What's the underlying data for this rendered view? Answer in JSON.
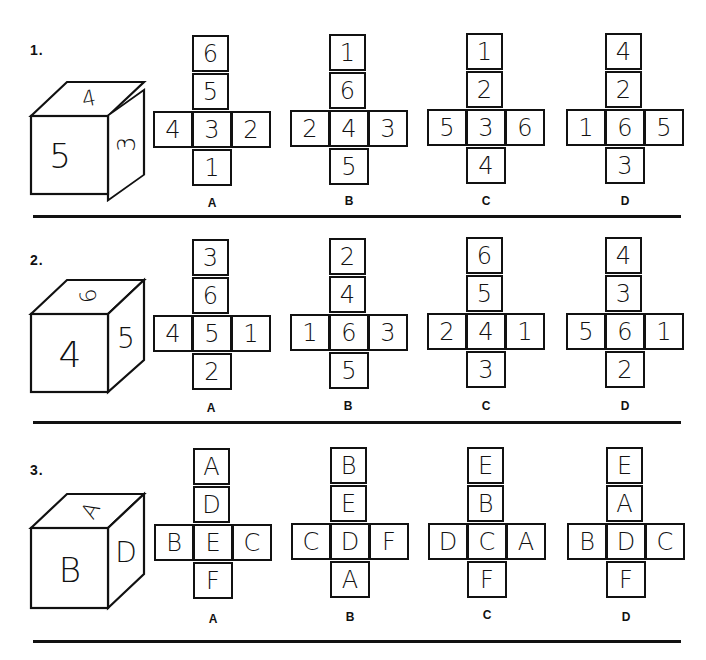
{
  "questions": [
    {
      "number": "1.",
      "cube": {
        "front": "5",
        "top": "4",
        "right": "3"
      },
      "options": [
        {
          "label": "A",
          "top": "6",
          "upper": "5",
          "left": "4",
          "center": "3",
          "right": "2",
          "bottom": "1"
        },
        {
          "label": "B",
          "top": "1",
          "upper": "6",
          "left": "2",
          "center": "4",
          "right": "3",
          "bottom": "5"
        },
        {
          "label": "C",
          "top": "1",
          "upper": "2",
          "left": "5",
          "center": "3",
          "right": "6",
          "bottom": "4"
        },
        {
          "label": "D",
          "top": "4",
          "upper": "2",
          "left": "1",
          "center": "6",
          "right": "5",
          "bottom": "3"
        }
      ]
    },
    {
      "number": "2.",
      "cube": {
        "front": "4",
        "top": "6",
        "right": "5"
      },
      "options": [
        {
          "label": "A",
          "top": "3",
          "upper": "6",
          "left": "4",
          "center": "5",
          "right": "1",
          "bottom": "2"
        },
        {
          "label": "B",
          "top": "2",
          "upper": "4",
          "left": "1",
          "center": "6",
          "right": "3",
          "bottom": "5"
        },
        {
          "label": "C",
          "top": "6",
          "upper": "5",
          "left": "2",
          "center": "4",
          "right": "1",
          "bottom": "3"
        },
        {
          "label": "D",
          "top": "4",
          "upper": "3",
          "left": "5",
          "center": "6",
          "right": "1",
          "bottom": "2"
        }
      ]
    },
    {
      "number": "3.",
      "cube": {
        "front": "B",
        "top": "A",
        "right": "D"
      },
      "options": [
        {
          "label": "A",
          "top": "A",
          "upper": "D",
          "left": "B",
          "center": "E",
          "right": "C",
          "bottom": "F"
        },
        {
          "label": "B",
          "top": "B",
          "upper": "E",
          "left": "C",
          "center": "D",
          "right": "F",
          "bottom": "A"
        },
        {
          "label": "C",
          "top": "E",
          "upper": "B",
          "left": "D",
          "center": "C",
          "right": "A",
          "bottom": "F"
        },
        {
          "label": "D",
          "top": "E",
          "upper": "A",
          "left": "B",
          "center": "D",
          "right": "C",
          "bottom": "F"
        }
      ]
    }
  ]
}
